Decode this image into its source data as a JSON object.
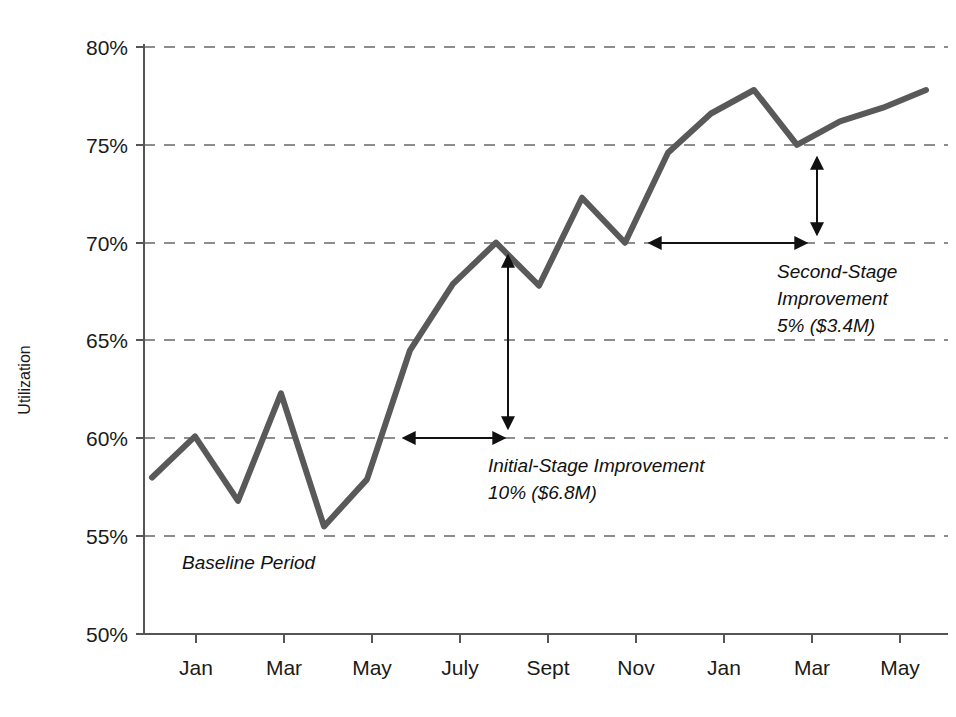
{
  "chart_data": {
    "type": "line",
    "title": "",
    "subtitle": "",
    "xlabel": "",
    "ylabel": "Utilization",
    "ylim": [
      50,
      80
    ],
    "ytick_labels": [
      "80%",
      "75%",
      "70%",
      "65%",
      "60%",
      "55%",
      "50%"
    ],
    "ytick_values": [
      80,
      75,
      70,
      65,
      60,
      55,
      50
    ],
    "xtick_labels": [
      "Jan",
      "Mar",
      "May",
      "July",
      "Sept",
      "Nov",
      "Jan",
      "Mar",
      "May"
    ],
    "grid": "horizontal-dashed",
    "legend": "none",
    "line_color": "#595959",
    "x": [
      0,
      1,
      2,
      3,
      4,
      5,
      6,
      7,
      8,
      9,
      10,
      11,
      12,
      13,
      14,
      15,
      16,
      17,
      18
    ],
    "x_point_labels": [
      "Jan",
      "Feb",
      "Mar",
      "Apr",
      "May",
      "June",
      "July",
      "Aug",
      "Sept",
      "Oct",
      "Nov",
      "Dec",
      "Jan",
      "Feb",
      "Mar",
      "Apr",
      "May",
      "June",
      "July"
    ],
    "values": [
      58.0,
      60.1,
      56.8,
      62.3,
      55.5,
      57.9,
      64.5,
      67.9,
      70.0,
      67.8,
      72.3,
      70.0,
      74.6,
      76.6,
      77.8,
      75.0,
      76.2,
      76.9,
      77.8
    ],
    "series": [
      {
        "name": "Utilization",
        "values": [
          58.0,
          60.1,
          56.8,
          62.3,
          55.5,
          57.9,
          64.5,
          67.9,
          70.0,
          67.8,
          72.3,
          70.0,
          74.6,
          76.6,
          77.8,
          75.0,
          76.2,
          76.9,
          77.8
        ]
      }
    ],
    "annotations": [
      {
        "id": "baseline-period",
        "text": "Baseline Period",
        "style": "italic",
        "kind": "text"
      },
      {
        "id": "initial-stage",
        "line1": "Initial-Stage Improvement",
        "line2": "10% ($6.8M)",
        "style": "italic",
        "kind": "text-with-arrows",
        "from_value": 60,
        "to_value": 70,
        "delta": "10%",
        "amount": "$6.8M"
      },
      {
        "id": "second-stage",
        "line1": "Second-Stage",
        "line2": "Improvement",
        "line3": "5% ($3.4M)",
        "style": "italic",
        "kind": "text-with-arrows",
        "from_value": 70,
        "to_value": 75,
        "delta": "5%",
        "amount": "$3.4M"
      }
    ]
  }
}
